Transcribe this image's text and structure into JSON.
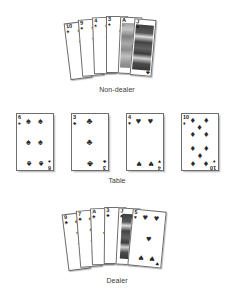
{
  "figure": {
    "background_color": "#ffffff",
    "ink_color": "#1a1a1a",
    "suit_glyphs": {
      "spade": "♠",
      "heart": "♥",
      "club": "♣",
      "diamond": "♦"
    }
  },
  "rows": [
    {
      "id": "non-dealer",
      "label": "Non-dealer",
      "cards": [
        {
          "rank": "10",
          "suit": "spade",
          "suit_glyph": "♠",
          "face": false,
          "pip_count": 4
        },
        {
          "rank": "9",
          "suit": "spade",
          "suit_glyph": "♠",
          "face": false,
          "pip_count": 4
        },
        {
          "rank": "4",
          "suit": "spade",
          "suit_glyph": "♠",
          "face": false,
          "pip_count": 4
        },
        {
          "rank": "3",
          "suit": "spade",
          "suit_glyph": "♠",
          "face": false,
          "pip_count": 2
        },
        {
          "rank": "A",
          "suit": "spade",
          "suit_glyph": "♠",
          "face": false,
          "pip_count": 1
        },
        {
          "rank": "J",
          "suit": "club",
          "suit_glyph": "♣",
          "face": true,
          "pip_count": 0
        }
      ]
    },
    {
      "id": "table",
      "label": "Table",
      "cards": [
        {
          "rank": "6",
          "suit": "spade",
          "suit_glyph": "♠",
          "pip_count": 6
        },
        {
          "rank": "3",
          "suit": "club",
          "suit_glyph": "♣",
          "pip_count": 3
        },
        {
          "rank": "4",
          "suit": "heart",
          "suit_glyph": "♥",
          "pip_count": 4
        },
        {
          "rank": "10",
          "suit": "diamond",
          "suit_glyph": "♦",
          "pip_count": 10
        }
      ]
    },
    {
      "id": "dealer",
      "label": "Dealer",
      "cards": [
        {
          "rank": "9",
          "suit": "club",
          "suit_glyph": "♣",
          "face": false,
          "pip_count": 4
        },
        {
          "rank": "7",
          "suit": "club",
          "suit_glyph": "♣",
          "face": false,
          "pip_count": 4
        },
        {
          "rank": "A",
          "suit": "club",
          "suit_glyph": "♣",
          "face": false,
          "pip_count": 1
        },
        {
          "rank": "3",
          "suit": "club",
          "suit_glyph": "♣",
          "face": false,
          "pip_count": 1
        },
        {
          "rank": "J",
          "suit": "spade",
          "suit_glyph": "♠",
          "face": true,
          "pip_count": 0
        },
        {
          "rank": "5",
          "suit": "heart",
          "suit_glyph": "♥",
          "face": false,
          "pip_count": 5
        }
      ]
    }
  ]
}
